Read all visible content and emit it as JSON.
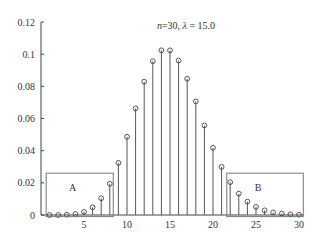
{
  "chart_data": {
    "type": "stem",
    "title_parts": {
      "n_label": "n",
      "n_value": "=30, ",
      "lambda_label": "λ",
      "lambda_value": " = 15.0"
    },
    "xlabel": "",
    "ylabel": "",
    "xlim": [
      0,
      31
    ],
    "ylim": [
      0,
      0.12
    ],
    "x_ticks": [
      5,
      10,
      15,
      20,
      25,
      30
    ],
    "y_ticks": [
      0,
      0.02,
      0.04,
      0.06,
      0.08,
      0.1,
      0.12
    ],
    "y_tick_labels": [
      "0",
      "0.02",
      "0.04",
      "0.06",
      "0.08",
      "0.1",
      "0.12"
    ],
    "grid": false,
    "x": [
      1,
      2,
      3,
      4,
      5,
      6,
      7,
      8,
      9,
      10,
      11,
      12,
      13,
      14,
      15,
      16,
      17,
      18,
      19,
      20,
      21,
      22,
      23,
      24,
      25,
      26,
      27,
      28,
      29,
      30
    ],
    "values": [
      0.0,
      0.0,
      0.0002,
      0.0006,
      0.0019,
      0.0048,
      0.0104,
      0.0194,
      0.0324,
      0.0486,
      0.0663,
      0.0829,
      0.0956,
      0.1024,
      0.1024,
      0.096,
      0.0847,
      0.0706,
      0.0557,
      0.0418,
      0.0299,
      0.0204,
      0.0133,
      0.0083,
      0.005,
      0.0029,
      0.0016,
      0.0009,
      0.0004,
      0.0002
    ],
    "annotations": [
      {
        "label": "A",
        "x_range": [
          0.6,
          8.4
        ],
        "y_range": [
          -0.001,
          0.026
        ]
      },
      {
        "label": "B",
        "x_range": [
          21.6,
          30.5
        ],
        "y_range": [
          -0.001,
          0.026
        ]
      }
    ]
  }
}
